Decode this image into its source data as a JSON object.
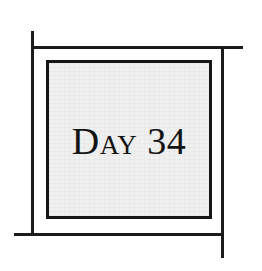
{
  "plaque": {
    "label": "Day 34",
    "day_word": "Day",
    "day_number": "34",
    "text_color": "#141414",
    "fill_color": "#f0f0f0",
    "border_color": "#161616"
  },
  "frame": {
    "line_color": "#1b1b1b",
    "style": "offset-rule-corners",
    "lines": [
      {
        "name": "left",
        "orientation": "vertical"
      },
      {
        "name": "top",
        "orientation": "horizontal"
      },
      {
        "name": "right",
        "orientation": "vertical"
      },
      {
        "name": "bottom",
        "orientation": "horizontal"
      }
    ]
  },
  "canvas": {
    "background_color": "#ffffff",
    "width": 262,
    "height": 271
  }
}
